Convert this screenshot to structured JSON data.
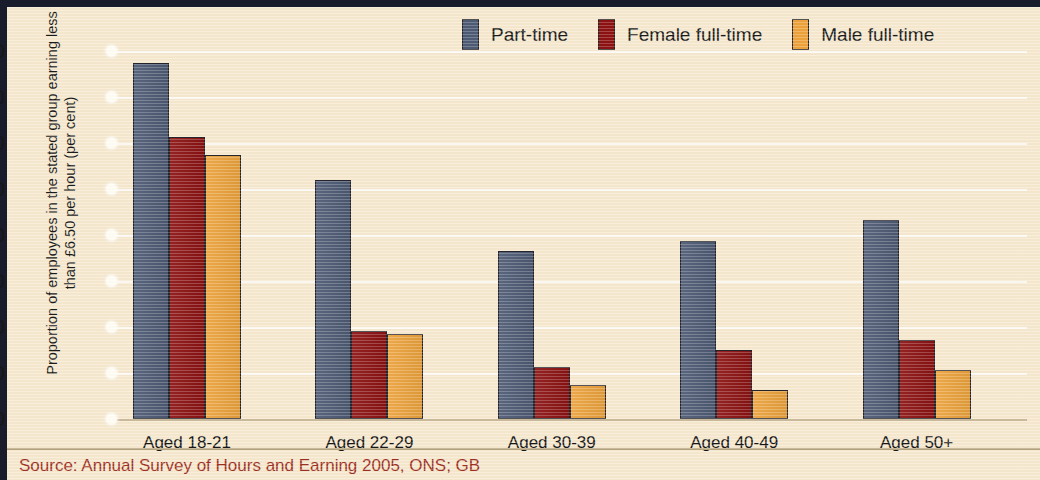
{
  "figure": {
    "background_color": "#f6e9cf",
    "frame_color": "#191c2b",
    "source_note": "Source: Annual Survey of Hours and Earning 2005, ONS; GB",
    "source_color": "#9e3024"
  },
  "chart_data": {
    "type": "bar",
    "title": "",
    "xlabel": "",
    "ylabel": "Proportion of employees in the stated group earning less than £6.50 per hour (per cent)",
    "categories": [
      "Aged 18-21",
      "Aged 22-29",
      "Aged 30-39",
      "Aged 40-49",
      "Aged 50+"
    ],
    "series": [
      {
        "name": "Part-time",
        "color": "#4e5b74",
        "values": [
          77.5,
          52.0,
          36.6,
          38.8,
          43.2
        ]
      },
      {
        "name": "Female full-time",
        "color": "#8d1212",
        "values": [
          61.4,
          19.1,
          11.4,
          15.0,
          17.2
        ]
      },
      {
        "name": "Male full-time",
        "color": "#eda33c",
        "values": [
          57.4,
          18.4,
          7.5,
          6.3,
          10.7
        ]
      }
    ],
    "ylim": [
      0,
      80
    ],
    "yticks": [
      0,
      10,
      20,
      30,
      40,
      50,
      60,
      70,
      80
    ],
    "ytick_labels": [
      "0",
      "10",
      "20",
      "30",
      "40",
      "50",
      "60",
      "70",
      "80"
    ],
    "grid": true,
    "grid_axis": "y",
    "legend_position": "top-right"
  }
}
